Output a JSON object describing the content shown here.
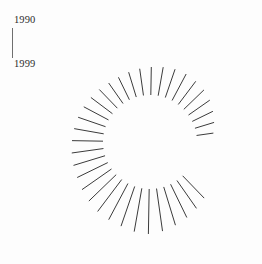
{
  "page": {
    "background_color": "#fdfdfd",
    "width": 262,
    "height": 264
  },
  "legend": {
    "name": "time-range-axis",
    "start_label": "1990",
    "end_label": "1999",
    "axis_color": "#6f6f6f",
    "text_color": "#2b2b2b"
  },
  "chart_data": {
    "type": "bar",
    "subtype": "radial-spoke-polar",
    "title": "",
    "subtitle": "",
    "xlabel": "",
    "ylabel": "",
    "legend_position": "top-left",
    "grid": false,
    "line_color": "#3b3b3b",
    "line_width": 1,
    "center": {
      "x": 150,
      "y": 142
    },
    "inner_radius": 47,
    "max_outer_radius": 92,
    "angle_units": "degrees, 0 = east (3 o'clock), increasing clockwise",
    "gap_start_deg": 352,
    "gap_end_deg": 46,
    "categories": [
      "46",
      "55",
      "64",
      "73",
      "82",
      "91",
      "100",
      "109",
      "118",
      "127",
      "136",
      "145",
      "154",
      "163",
      "172",
      "181",
      "190",
      "199",
      "208",
      "217",
      "226",
      "235",
      "244",
      "253",
      "262",
      "271",
      "280",
      "289",
      "298",
      "307",
      "316",
      "325",
      "334",
      "343",
      "352"
    ],
    "values": [
      31,
      34,
      37,
      40,
      43,
      45,
      44,
      42,
      41,
      40,
      38,
      36,
      34,
      33,
      32,
      31,
      30,
      29,
      28,
      27,
      26,
      25,
      25,
      26,
      27,
      28,
      29,
      30,
      30,
      29,
      28,
      26,
      23,
      20,
      17
    ],
    "series": [
      {
        "name": "radial magnitude",
        "values": [
          31,
          34,
          37,
          40,
          43,
          45,
          44,
          42,
          41,
          40,
          38,
          36,
          34,
          33,
          32,
          31,
          30,
          29,
          28,
          27,
          26,
          25,
          25,
          26,
          27,
          28,
          29,
          30,
          30,
          29,
          28,
          26,
          23,
          20,
          17
        ]
      }
    ],
    "ylim": [
      0,
      48
    ],
    "annotations": [
      {
        "text": "1990",
        "role": "range-start"
      },
      {
        "text": "1999",
        "role": "range-end"
      }
    ]
  }
}
